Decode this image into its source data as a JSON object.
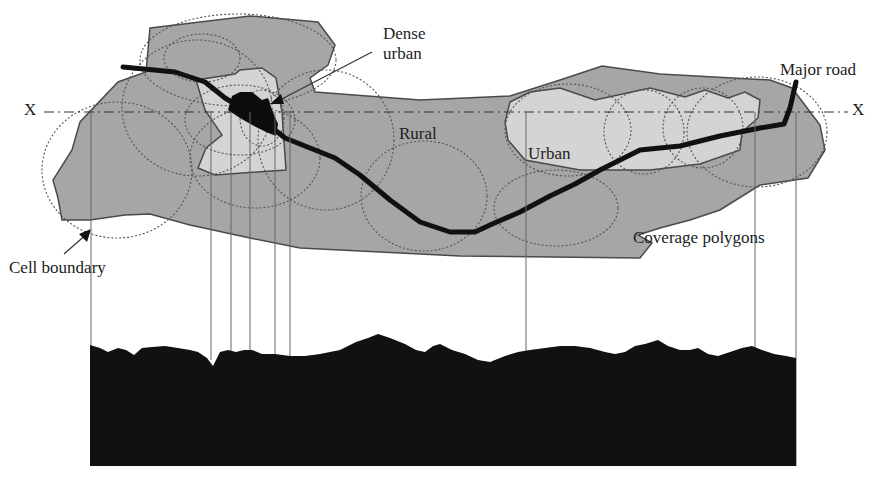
{
  "diagram": {
    "title": "",
    "labels": {
      "dense_urban_line1": "Dense",
      "dense_urban_line2": "urban",
      "major_road": "Major road",
      "rural": "Rural",
      "urban": "Urban",
      "coverage_polygons": "Coverage polygons",
      "cell_boundary": "Cell boundary",
      "x_left": "X",
      "x_right": "X"
    },
    "colors": {
      "rural_fill": "#a6a6a6",
      "urban_fill": "#d4d4d4",
      "outline": "#4a4a4a",
      "road": "#111111",
      "dense_urban": "#0d0d0d",
      "terrain": "#111111",
      "cell_circle": "#555555",
      "background": "#ffffff"
    },
    "elements": [
      {
        "type": "region",
        "name": "Rural coverage area"
      },
      {
        "type": "region",
        "name": "Urban area (left)"
      },
      {
        "type": "region",
        "name": "Urban area (right)"
      },
      {
        "type": "region",
        "name": "Dense urban core"
      },
      {
        "type": "path",
        "name": "Major road"
      },
      {
        "type": "line",
        "name": "Cross-section line X–X"
      },
      {
        "type": "circles",
        "name": "Cell boundaries (dotted)"
      },
      {
        "type": "profile",
        "name": "Terrain cross-section"
      },
      {
        "type": "projection-lines",
        "name": "Vertical projection lines from cell edges to terrain"
      }
    ]
  }
}
